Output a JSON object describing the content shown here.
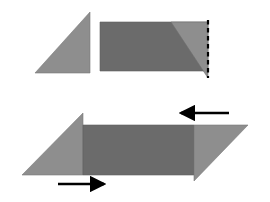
{
  "figure": {
    "title": "Paper folding diagram",
    "background_color": "#ffffff",
    "colors": {
      "light_gray": "#8e8e8e",
      "dark_gray": "#6b6b6b",
      "mid_gray": "#7d7d7d",
      "outline": "#5a5a5a",
      "arrow": "#000000",
      "dashed_line": "#000000"
    },
    "panels": [
      {
        "name": "top-panel",
        "label": "Step 1",
        "shapes": [
          {
            "name": "left-triangle",
            "kind": "triangle",
            "fill": "light_gray",
            "points": "35,73 90,73 90,12"
          },
          {
            "name": "folded-rectangle",
            "kind": "rectangle",
            "fill": "dark_gray",
            "points": "100,22 208,22 208,71 100,71"
          },
          {
            "name": "flap-triangle",
            "kind": "triangle",
            "fill": "light_gray",
            "points": "171,22 208,22 208,78"
          },
          {
            "name": "fold-crease-line",
            "kind": "dashed-line",
            "stroke": "dashed_line",
            "points": "208,20 208,78"
          }
        ]
      },
      {
        "name": "bottom-panel",
        "label": "Step 2",
        "shapes": [
          {
            "name": "left-wing-triangle",
            "kind": "triangle",
            "fill": "light_gray",
            "points": "22,175 83,175 83,113"
          },
          {
            "name": "center-rectangle",
            "kind": "rectangle",
            "fill": "dark_gray",
            "points": "83,125 194,125 194,175 83,175"
          },
          {
            "name": "right-wing-triangle",
            "kind": "triangle",
            "fill": "light_gray",
            "points": "194,125 248,125 194,181"
          },
          {
            "name": "arrow-right",
            "kind": "arrow",
            "direction": "right",
            "stroke": "arrow",
            "points": "58,184 108,184"
          },
          {
            "name": "arrow-left",
            "kind": "arrow",
            "direction": "left",
            "stroke": "arrow",
            "points": "229,113 177,113"
          }
        ]
      }
    ]
  }
}
